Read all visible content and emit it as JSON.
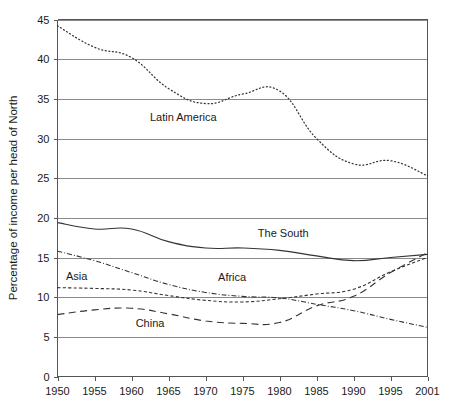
{
  "chart_data": {
    "type": "line",
    "title": "",
    "xlabel": "",
    "ylabel": "Percentage of income per head of North",
    "xlim": [
      1950,
      2001
    ],
    "ylim": [
      0,
      45
    ],
    "grid": true,
    "legend_position": "inline-labels",
    "x_ticks": [
      "1950",
      "1955",
      "1960",
      "1965",
      "1970",
      "1975",
      "1980",
      "1985",
      "1990",
      "1995",
      "2001"
    ],
    "x_tick_values": [
      1950,
      1955,
      1960,
      1965,
      1970,
      1975,
      1980,
      1985,
      1990,
      1995,
      2001
    ],
    "y_ticks": [
      "0",
      "5",
      "10",
      "15",
      "20",
      "25",
      "30",
      "35",
      "40",
      "45"
    ],
    "y_tick_values": [
      0,
      5,
      10,
      15,
      20,
      25,
      30,
      35,
      40,
      45
    ],
    "x": [
      1950,
      1955,
      1960,
      1965,
      1970,
      1975,
      1980,
      1985,
      1990,
      1995,
      2001
    ],
    "series": [
      {
        "name": "Latin America",
        "style": "dotted",
        "label_x": 1967,
        "label_y": 32.2,
        "values": [
          44.2,
          41.5,
          40.2,
          36.3,
          34.4,
          35.6,
          36.0,
          30.0,
          26.8,
          27.2,
          25.3
        ]
      },
      {
        "name": "The South",
        "style": "solid",
        "label_x": 1980.5,
        "label_y": 17.6,
        "values": [
          19.4,
          18.6,
          18.6,
          17.0,
          16.2,
          16.2,
          15.9,
          15.2,
          14.6,
          15.0,
          15.4
        ]
      },
      {
        "name": "Africa",
        "style": "dash-dot",
        "label_x": 1973.6,
        "label_y": 12.1,
        "values": [
          15.8,
          14.6,
          13.1,
          11.6,
          10.6,
          10.1,
          9.9,
          9.1,
          8.3,
          7.2,
          6.2
        ]
      },
      {
        "name": "Asia",
        "style": "dashed-fine",
        "label_x": 1952.6,
        "label_y": 12.2,
        "values": [
          11.2,
          11.1,
          10.9,
          10.2,
          9.6,
          9.4,
          9.8,
          10.4,
          11.0,
          13.2,
          15.0
        ]
      },
      {
        "name": "China",
        "style": "dashed-long",
        "label_x": 1962.5,
        "label_y": 6.3,
        "values": [
          7.8,
          8.4,
          8.6,
          7.9,
          7.0,
          6.7,
          6.8,
          8.9,
          10.1,
          13.1,
          15.6
        ]
      }
    ]
  }
}
